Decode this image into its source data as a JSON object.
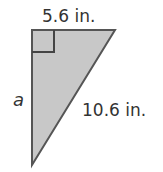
{
  "diagram": {
    "type": "right-triangle",
    "top_side_label": "5.6 in.",
    "left_side_label": "a",
    "hypotenuse_label": "10.6 in.",
    "right_angle_marker": true,
    "fill_color": "#c8c8c8",
    "stroke_color": "#555555"
  }
}
